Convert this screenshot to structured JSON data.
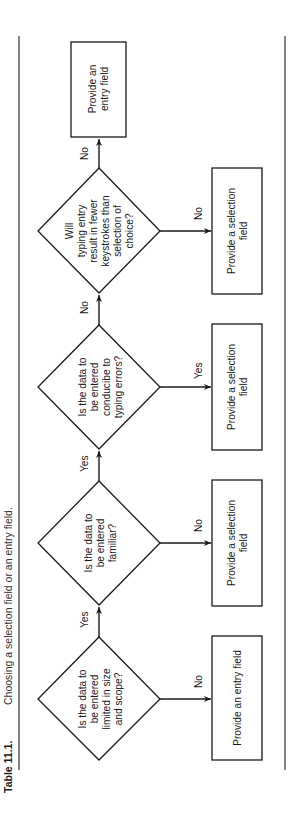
{
  "caption": {
    "label": "Table 11.1.",
    "title": "Choosing a selection field or an entry field."
  },
  "flow": {
    "decisions": [
      {
        "id": "d1",
        "lines": [
          "Is the data to",
          "be entered",
          "limited in size",
          "and scope?"
        ]
      },
      {
        "id": "d2",
        "lines": [
          "Is the data to",
          "be entered",
          "familiar?"
        ]
      },
      {
        "id": "d3",
        "lines": [
          "Is the data to",
          "be entered",
          "conducibe to",
          "typing errors?"
        ]
      },
      {
        "id": "d4",
        "lines": [
          "Will",
          "typing entry",
          "result in fewer",
          "keystrokes than",
          "selection of",
          "choice?"
        ]
      }
    ],
    "outcomes": [
      {
        "id": "o1",
        "from": "d1",
        "branch": "No",
        "lines": [
          "Provide an entry field"
        ]
      },
      {
        "id": "o2",
        "from": "d2",
        "branch": "No",
        "lines": [
          "Provide a selection",
          "field"
        ]
      },
      {
        "id": "o3",
        "from": "d3",
        "branch": "Yes",
        "lines": [
          "Provide a selection",
          "field"
        ]
      },
      {
        "id": "o4",
        "from": "d4",
        "branch": "No",
        "lines": [
          "Provide a selection",
          "field"
        ]
      },
      {
        "id": "o5",
        "from": "d4",
        "branch": "No",
        "lines": [
          "Provide an",
          "entry field"
        ]
      }
    ],
    "main_path": [
      {
        "from": "d1",
        "to": "d2",
        "branch": "Yes"
      },
      {
        "from": "d2",
        "to": "d3",
        "branch": "Yes"
      },
      {
        "from": "d3",
        "to": "d4",
        "branch": "No"
      },
      {
        "from": "d4",
        "to": "o5",
        "branch": "No"
      }
    ]
  },
  "colors": {
    "line": "#1a1a1a",
    "background": "#ffffff"
  }
}
